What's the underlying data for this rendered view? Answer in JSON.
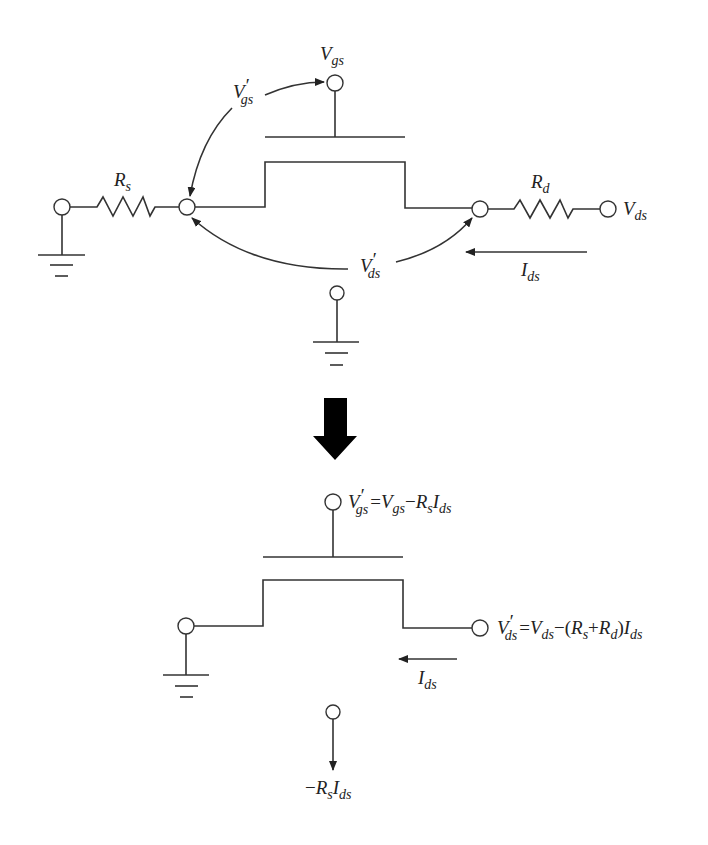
{
  "figure": {
    "top_circuit": {
      "title": "MOSFET with parasitic source and drain resistances",
      "labels": {
        "gate_node": {
          "main": "V",
          "sub": "gs"
        },
        "gate_internal": {
          "main": "V",
          "prime": "′",
          "sub": "gs"
        },
        "source_resistor": {
          "main": "R",
          "sub": "s"
        },
        "drain_resistor": {
          "main": "R",
          "sub": "d"
        },
        "drain_node": {
          "main": "V",
          "sub": "ds"
        },
        "drain_internal": {
          "main": "V",
          "prime": "′",
          "sub": "ds"
        },
        "current": {
          "main": "I",
          "sub": "ds"
        }
      }
    },
    "transform_arrow": "down-arrow",
    "bottom_circuit": {
      "title": "Equivalent intrinsic MOSFET",
      "labels": {
        "gate_eq": {
          "main": "V",
          "prime": "′",
          "sub": "gs",
          "eq": "=",
          "rhs1_main": "V",
          "rhs1_sub": "gs",
          "minus": "−",
          "rhs2_main": "R",
          "rhs2_sub": "s",
          "rhs3_main": "I",
          "rhs3_sub": "ds"
        },
        "drain_eq": {
          "main": "V",
          "prime": "′",
          "sub": "ds",
          "eq": "=",
          "rhs1_main": "V",
          "rhs1_sub": "ds",
          "minus": "−(",
          "rs_main": "R",
          "rs_sub": "s",
          "plus": "+",
          "rd_main": "R",
          "rd_sub": "d",
          "close": ")",
          "i_main": "I",
          "i_sub": "ds"
        },
        "current": {
          "main": "I",
          "sub": "ds"
        },
        "body_eq": {
          "minus": "−",
          "r_main": "R",
          "r_sub": "s",
          "i_main": "I",
          "i_sub": "ds"
        }
      }
    },
    "colors": {
      "line": "#333333",
      "text": "#222222",
      "background": "#ffffff"
    }
  }
}
